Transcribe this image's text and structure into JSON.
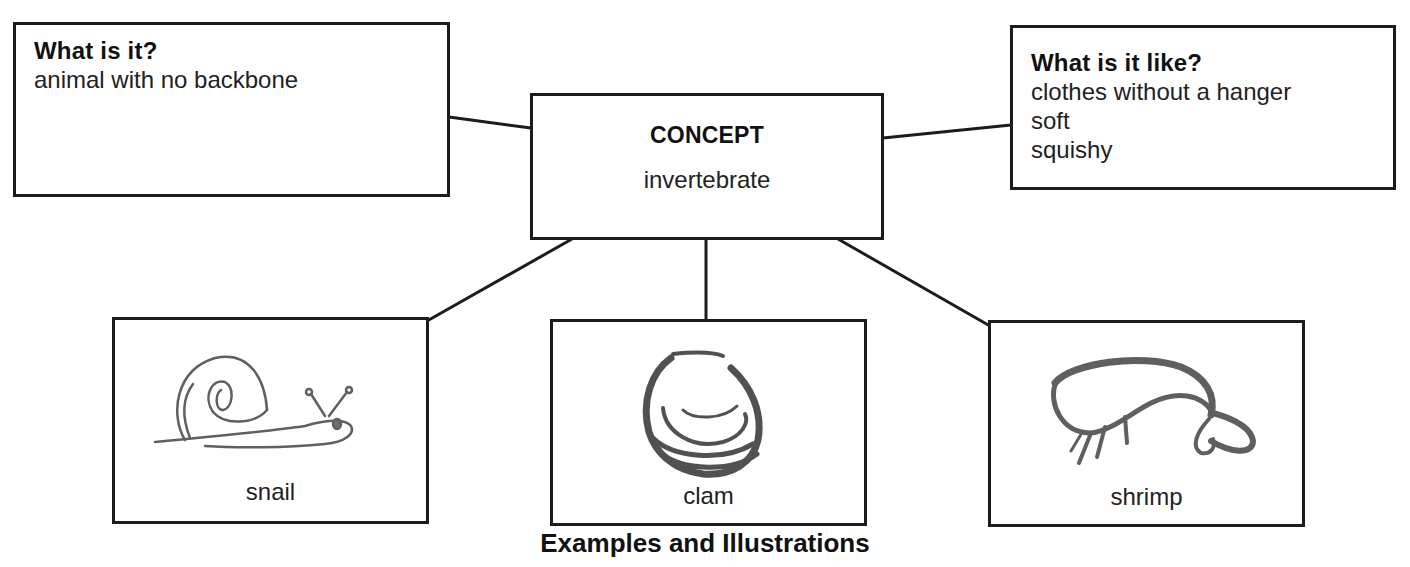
{
  "diagram": {
    "type": "concept-map",
    "concept_box": {
      "heading": "CONCEPT",
      "term": "invertebrate"
    },
    "definition_box": {
      "heading": "What is it?",
      "lines": [
        "animal with no backbone"
      ]
    },
    "properties_box": {
      "heading": "What is it like?",
      "lines": [
        "clothes without a hanger",
        "soft",
        "squishy"
      ]
    },
    "examples": [
      {
        "label": "snail",
        "illustration": "snail-sketch-icon"
      },
      {
        "label": "clam",
        "illustration": "clam-sketch-icon"
      },
      {
        "label": "shrimp",
        "illustration": "shrimp-sketch-icon"
      }
    ],
    "caption": "Examples and Illustrations",
    "colors": {
      "line": "#1c1c1c",
      "background": "#ffffff",
      "text": "#1a1a1a"
    }
  }
}
